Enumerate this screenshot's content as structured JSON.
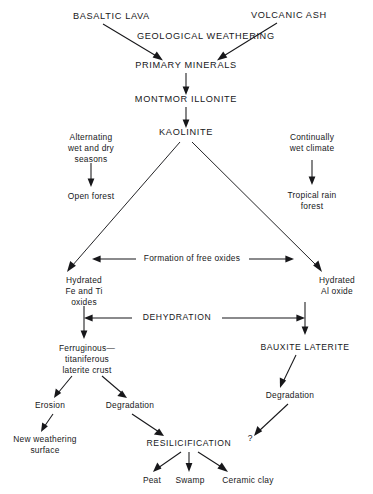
{
  "diagram": {
    "nodes": {
      "basaltic_lava": "BASALTIC LAVA",
      "volcanic_ash": "VOLCANIC ASH",
      "geological_weathering": "GEOLOGICAL WEATHERING",
      "primary_minerals": "PRIMARY MINERALS",
      "montmor_illonite": "MONTMOR ILLONITE",
      "kaolinite": "KAOLINITE",
      "alternating_1": "Alternating",
      "alternating_2": "wet and dry",
      "alternating_3": "seasons",
      "open_forest": "Open forest",
      "continually_1": "Continually",
      "continually_2": "wet climate",
      "tropical_rain_1": "Tropical rain",
      "tropical_rain_2": "forest",
      "formation_free_oxides": "Formation of free oxides",
      "hydrated_fe_1": "Hydrated",
      "hydrated_fe_2": "Fe and Ti",
      "hydrated_fe_3": "oxides",
      "hydrated_al_1": "Hydrated",
      "hydrated_al_2": "Al oxide",
      "dehydration": "DEHYDRATION",
      "ferruginous_1": "Ferruginous—",
      "ferruginous_2": "titaniferous",
      "ferruginous_3": "laterite crust",
      "bauxite_laterite": "BAUXITE LATERITE",
      "erosion": "Erosion",
      "degradation_left": "Degradation",
      "degradation_right": "Degradation",
      "new_weathering_1": "New weathering",
      "new_weathering_2": "surface",
      "resilicification": "RESILICIFICATION",
      "question_mark": "?",
      "peat": "Peat",
      "swamp": "Swamp",
      "ceramic_clay": "Ceramic clay"
    },
    "colors": {
      "ink": "#17171a",
      "background": "#ffffff"
    }
  }
}
